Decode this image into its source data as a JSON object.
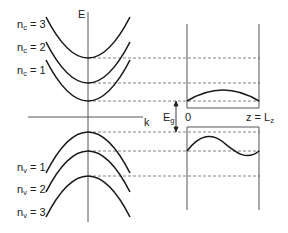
{
  "diagram": {
    "title": "",
    "axes": {
      "energy_label": "E",
      "wavevector_label": "k"
    },
    "conduction_subbands": [
      {
        "label_main": "n",
        "label_sub": "c",
        "label_rest": " = 3",
        "min_y": 58
      },
      {
        "label_main": "n",
        "label_sub": "c",
        "label_rest": " = 2",
        "min_y": 83
      },
      {
        "label_main": "n",
        "label_sub": "c",
        "label_rest": " = 1",
        "min_y": 101
      }
    ],
    "valence_subbands": [
      {
        "label_main": "n",
        "label_sub": "v",
        "label_rest": " = 1",
        "max_y": 132
      },
      {
        "label_main": "n",
        "label_sub": "v",
        "label_rest": " = 2",
        "max_y": 151
      },
      {
        "label_main": "n",
        "label_sub": "v",
        "label_rest": " = 3",
        "max_y": 176
      }
    ],
    "bandgap": {
      "label_main": "E",
      "label_sub": "g"
    },
    "quantum_well": {
      "left_label": "0",
      "right_label_main": "z = L",
      "right_label_sub": "z"
    },
    "colors": {
      "curve": "#1a1a1a",
      "axis": "#555555",
      "dashed": "#777777",
      "background": "#ffffff"
    }
  }
}
